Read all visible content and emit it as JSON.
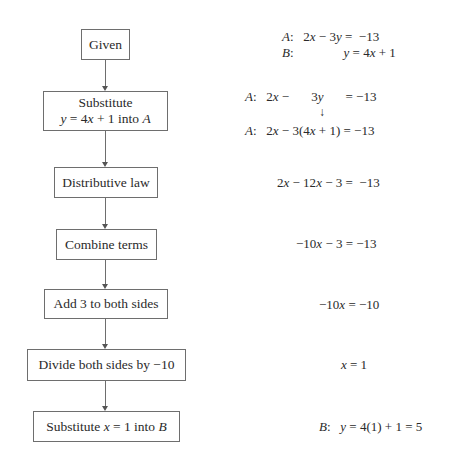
{
  "diagram": {
    "type": "flowchart",
    "steps": [
      {
        "label": "Given",
        "equations": [
          {
            "label": "A:",
            "expr": "2x − 3y = −13"
          },
          {
            "label": "B:",
            "expr": "y = 4x + 1"
          }
        ]
      },
      {
        "label_line1": "Substitute",
        "label_line2": "y = 4x + 1 into A",
        "equations": [
          {
            "label": "A:",
            "expr": "2x −    3y    = −13"
          },
          {
            "label": "A:",
            "expr": "2x − 3(4x + 1) = −13"
          }
        ]
      },
      {
        "label": "Distributive law",
        "equation": "2x − 12x − 3 = −13"
      },
      {
        "label": "Combine terms",
        "equation": "−10x − 3 = −13"
      },
      {
        "label": "Add 3 to both sides",
        "equation": "−10x = −10"
      },
      {
        "label": "Divide both sides by −10",
        "equation": "x = 1"
      },
      {
        "label": "Substitute x = 1 into B",
        "equation_label": "B:",
        "equation": "y = 4(1) + 1 = 5"
      }
    ],
    "arrow_glyph": "↓"
  }
}
